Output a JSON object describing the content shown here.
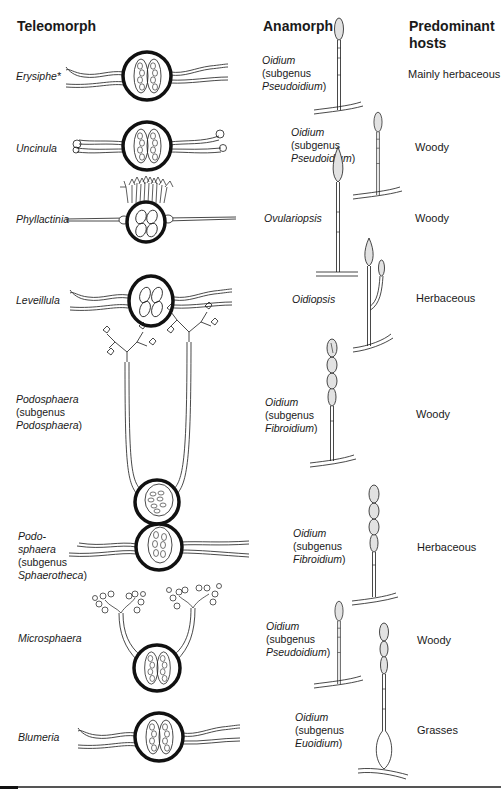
{
  "headers": {
    "teleomorph": "Teleomorph",
    "anamorph": "Anamorph",
    "hosts_line1": "Predominant",
    "hosts_line2": "hosts"
  },
  "rows": [
    {
      "teleomorph": {
        "line1": "Erysiphe*"
      },
      "anamorph": {
        "line1": "Oidium",
        "line2": "(subgenus",
        "line3": "Pseudoidium",
        "line3_suffix": ")"
      },
      "host": "Mainly herbaceous",
      "appendage_type": "mycelioid"
    },
    {
      "teleomorph": {
        "line1": "Uncinula"
      },
      "anamorph": {
        "line1": "Oidium",
        "line2": "(subgenus",
        "line3": "Pseudoidium",
        "line3_suffix": ")"
      },
      "host": "Woody",
      "appendage_type": "uncinate"
    },
    {
      "teleomorph": {
        "line1": "Phyllactinia"
      },
      "anamorph": {
        "line1": "Ovulariopsis"
      },
      "host": "Woody",
      "appendage_type": "acicular"
    },
    {
      "teleomorph": {
        "line1": "Leveillula"
      },
      "anamorph": {
        "line1": "Oidiopsis"
      },
      "host": "Herbaceous",
      "appendage_type": "mycelioid"
    },
    {
      "teleomorph": {
        "line1": "Podosphaera",
        "line2": "(subgenus",
        "line3": "Podosphaera",
        "line3_suffix": ")"
      },
      "anamorph": {
        "line1": "Oidium",
        "line2": "(subgenus",
        "line3": "Fibroidium",
        "line3_suffix": ")"
      },
      "host": "Woody",
      "appendage_type": "dichotomous"
    },
    {
      "teleomorph": {
        "line1": "Podo-",
        "line2": "sphaera",
        "line3": "(subgenus",
        "line4": "Sphaerotheca",
        "line4_suffix": ")"
      },
      "anamorph": {
        "line1": "Oidium",
        "line2": "(subgenus",
        "line3": "Fibroidium",
        "line3_suffix": ")"
      },
      "host": "Herbaceous",
      "appendage_type": "mycelioid"
    },
    {
      "teleomorph": {
        "line1": "Microsphaera"
      },
      "anamorph": {
        "line1": "Oidium",
        "line2": "(subgenus",
        "line3": "Pseudoidium",
        "line3_suffix": ")"
      },
      "host": "Woody",
      "appendage_type": "dichotomous-curled"
    },
    {
      "teleomorph": {
        "line1": "Blumeria"
      },
      "anamorph": {
        "line1": "Oidium",
        "line2": "(subgenus",
        "line3": "Euoidium",
        "line3_suffix": ")"
      },
      "host": "Grasses",
      "appendage_type": "mycelioid"
    }
  ],
  "colors": {
    "ink": "#1a1a1a",
    "conidium_fill": "#e2e2e2",
    "rule": "#555555"
  }
}
